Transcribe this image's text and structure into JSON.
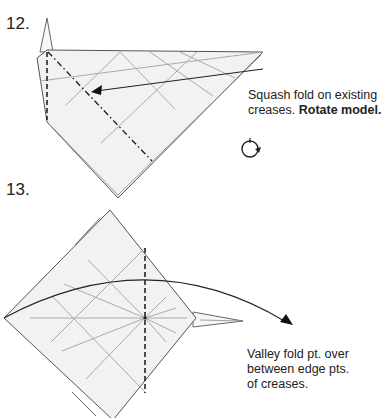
{
  "steps": [
    {
      "number": "12.",
      "caption_plain": "Squash fold on existing creases. ",
      "caption_bold": "Rotate model.",
      "icons": [
        "rotate-model-icon",
        "arrow-icon"
      ]
    },
    {
      "number": "13.",
      "caption_lines": [
        "Valley fold pt. over",
        "between edge pts.",
        "of creases."
      ],
      "icons": [
        "arrow-icon"
      ]
    }
  ],
  "colors": {
    "paper_fill": "#f2f2f2",
    "outline": "#555555",
    "crease": "#aaaaaa",
    "fold_line": "#222222"
  }
}
